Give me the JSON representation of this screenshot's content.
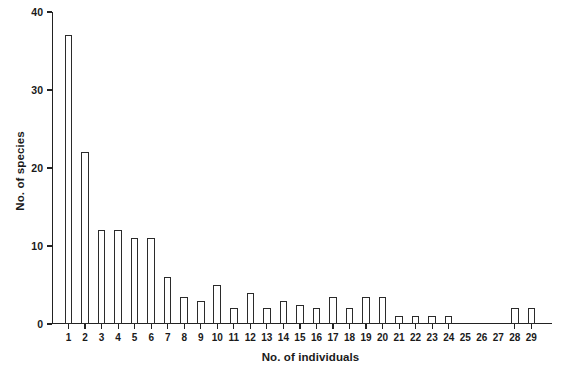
{
  "chart_data": {
    "type": "bar",
    "title": "",
    "subtitle": "",
    "xlabel": "No. of individuals",
    "ylabel": "No. of species",
    "categories": [
      "1",
      "2",
      "3",
      "4",
      "5",
      "6",
      "7",
      "8",
      "9",
      "10",
      "11",
      "12",
      "13",
      "14",
      "15",
      "16",
      "17",
      "18",
      "19",
      "20",
      "21",
      "22",
      "23",
      "24",
      "25",
      "26",
      "27",
      "28",
      "29"
    ],
    "values": [
      37,
      22,
      12,
      12,
      11,
      11,
      6,
      3.5,
      3,
      5,
      2,
      4,
      2,
      3,
      2.5,
      2,
      3.5,
      2,
      3.5,
      3.5,
      1,
      1,
      1,
      1,
      0,
      0,
      0,
      2,
      2
    ],
    "ylim": [
      0,
      40
    ],
    "yticks": [
      0,
      10,
      20,
      30,
      40
    ],
    "ytick_labels": [
      "0",
      "10",
      "20",
      "30",
      "40"
    ],
    "xlim": [
      0.5,
      29.5
    ],
    "grid": false,
    "legend": null,
    "legend_position": "none",
    "annotations": [],
    "bar_color": "#ffffff",
    "bar_edge_color": "#2b2b2b",
    "axis_color": "#222222",
    "background": "#ffffff"
  }
}
